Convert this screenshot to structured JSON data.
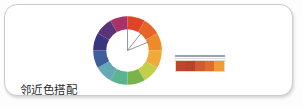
{
  "caption": {
    "label": "邻近色搭配"
  },
  "card": {
    "background_color": "#ffffff",
    "border_color": "#c9cbcc"
  },
  "chart_data": {
    "type": "pie",
    "title": "邻近色搭配",
    "subtitle": "",
    "xlabel": "",
    "ylabel": "",
    "legend_position": "none",
    "grid": false,
    "categories": [
      "red",
      "red-orange",
      "orange",
      "yellow-orange",
      "yellow-green",
      "green",
      "teal-green",
      "teal",
      "blue",
      "indigo",
      "purple",
      "magenta"
    ],
    "values": [
      30,
      30,
      30,
      30,
      30,
      30,
      30,
      30,
      30,
      30,
      30,
      30
    ],
    "colors": [
      "#e14425",
      "#e8642a",
      "#ef8a28",
      "#f0a93a",
      "#c3cf4a",
      "#79b44a",
      "#5bb392",
      "#63aab5",
      "#3f5e9c",
      "#39357e",
      "#5b3379",
      "#a8336b"
    ],
    "start_angle_deg": -90,
    "inner_radius_ratio": 0.62,
    "markers": {
      "name": "analogous-range-indicator",
      "vertex": "wheel-center",
      "angles_deg": [
        0,
        38,
        68
      ],
      "color": "#6f7175"
    }
  },
  "palette": {
    "name": "analogous-swatch-bar",
    "swatches": [
      {
        "label": "swatch-1",
        "color": "#c2442a"
      },
      {
        "label": "swatch-2",
        "color": "#b9422c"
      },
      {
        "label": "swatch-3",
        "color": "#d4592b"
      },
      {
        "label": "swatch-4",
        "color": "#e06b2c"
      },
      {
        "label": "swatch-5",
        "color": "#f29b36"
      }
    ],
    "rule_color": "#9aa3ac"
  }
}
